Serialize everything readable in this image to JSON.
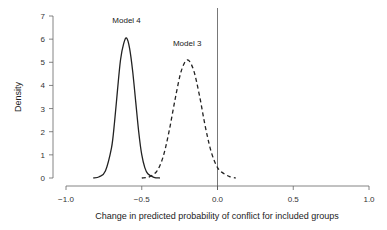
{
  "chart_data": {
    "type": "line",
    "title": "",
    "xlabel": "Change in predicted probability of conflict for included groups",
    "ylabel": "Density",
    "xlim": [
      -1.0,
      1.0
    ],
    "ylim": [
      0,
      7
    ],
    "xticks": [
      "-1.0",
      "-0.5",
      "0.0",
      "0.5",
      "1.0"
    ],
    "yticks": [
      "0",
      "1",
      "2",
      "3",
      "4",
      "5",
      "6",
      "7"
    ],
    "reference_line_x": 0.0,
    "grid": false,
    "series": [
      {
        "name": "Model 4",
        "style": "solid",
        "x": [
          -0.82,
          -0.78,
          -0.74,
          -0.7,
          -0.68,
          -0.66,
          -0.64,
          -0.62,
          -0.6,
          -0.58,
          -0.56,
          -0.54,
          -0.52,
          -0.5,
          -0.48,
          -0.46,
          -0.42,
          -0.38
        ],
        "y": [
          0.0,
          0.05,
          0.3,
          1.3,
          2.4,
          3.8,
          5.1,
          5.8,
          6.05,
          5.6,
          4.6,
          3.3,
          2.0,
          1.0,
          0.45,
          0.18,
          0.03,
          0.0
        ]
      },
      {
        "name": "Model 3",
        "style": "dashed",
        "x": [
          -0.5,
          -0.45,
          -0.4,
          -0.36,
          -0.32,
          -0.28,
          -0.24,
          -0.2,
          -0.16,
          -0.12,
          -0.08,
          -0.04,
          0.0,
          0.04,
          0.08,
          0.12
        ],
        "y": [
          0.0,
          0.05,
          0.3,
          0.9,
          2.0,
          3.4,
          4.6,
          5.1,
          4.7,
          3.6,
          2.2,
          1.1,
          0.45,
          0.2,
          0.06,
          0.0
        ]
      }
    ],
    "annotations": [
      {
        "text": "Model 4",
        "x": -0.6,
        "y": 6.7
      },
      {
        "text": "Model 3",
        "x": -0.2,
        "y": 5.7
      }
    ]
  }
}
